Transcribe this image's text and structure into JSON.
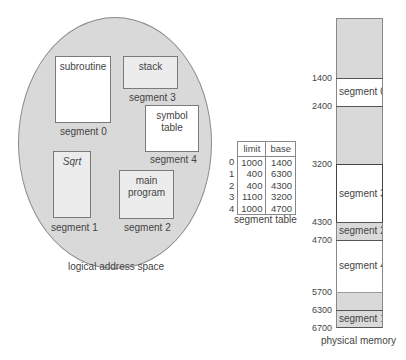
{
  "logical": {
    "caption": "logical address space",
    "segments": [
      {
        "content": "subroutine",
        "label": "segment 0"
      },
      {
        "content": "Sqrt",
        "label": "segment 1"
      },
      {
        "content_line1": "main",
        "content_line2": "program",
        "label": "segment 2"
      },
      {
        "content": "stack",
        "label": "segment 3"
      },
      {
        "content_line1": "symbol",
        "content_line2": "table",
        "label": "segment 4"
      }
    ]
  },
  "segment_table": {
    "caption": "segment table",
    "headers": [
      "limit",
      "base"
    ],
    "rows": [
      {
        "index": "0",
        "limit": "1000",
        "base": "1400"
      },
      {
        "index": "1",
        "limit": "400",
        "base": "6300"
      },
      {
        "index": "2",
        "limit": "400",
        "base": "4300"
      },
      {
        "index": "3",
        "limit": "1100",
        "base": "3200"
      },
      {
        "index": "4",
        "limit": "1000",
        "base": "4700"
      }
    ]
  },
  "physical": {
    "caption": "physical memory",
    "addresses": [
      "1400",
      "2400",
      "3200",
      "4300",
      "4700",
      "5700",
      "6300",
      "6700"
    ],
    "blocks": [
      {
        "label": "segment 0"
      },
      {
        "label": "segment 3"
      },
      {
        "label": "segment 2"
      },
      {
        "label": "segment 4"
      },
      {
        "label": "segment 1"
      }
    ]
  }
}
